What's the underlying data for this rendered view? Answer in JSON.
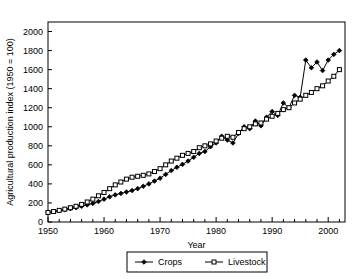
{
  "chart_data": {
    "type": "line",
    "title": "",
    "xlabel": "Year",
    "ylabel": "Agricultural production index (1950 = 100)",
    "xlim": [
      1950,
      2003
    ],
    "ylim": [
      0,
      2100
    ],
    "xticks": [
      1950,
      1960,
      1970,
      1980,
      1990,
      2000
    ],
    "xtick_labels": [
      "1950",
      "1960",
      "1970",
      "1980",
      "1990",
      "2000"
    ],
    "x_minor_tick_step": 2,
    "yticks": [
      0,
      200,
      400,
      600,
      800,
      1000,
      1200,
      1400,
      1600,
      1800,
      2000
    ],
    "ytick_labels": [
      "0",
      "200",
      "400",
      "600",
      "800",
      "1000",
      "1200",
      "1400",
      "1600",
      "1800",
      "2000"
    ],
    "grid": false,
    "legend_position": "below-center",
    "x": [
      1950,
      1951,
      1952,
      1953,
      1954,
      1955,
      1956,
      1957,
      1958,
      1959,
      1960,
      1961,
      1962,
      1963,
      1964,
      1965,
      1966,
      1967,
      1968,
      1969,
      1970,
      1971,
      1972,
      1973,
      1974,
      1975,
      1976,
      1977,
      1978,
      1979,
      1980,
      1981,
      1982,
      1983,
      1984,
      1985,
      1986,
      1987,
      1988,
      1989,
      1990,
      1991,
      1992,
      1993,
      1994,
      1995,
      1996,
      1997,
      1998,
      1999,
      2000,
      2001,
      2002
    ],
    "series": [
      {
        "name": "Crops",
        "marker": "filled-diamond",
        "color": "#000000",
        "values": [
          100,
          108,
          118,
          128,
          140,
          150,
          165,
          180,
          195,
          215,
          240,
          265,
          285,
          300,
          315,
          330,
          350,
          375,
          400,
          430,
          460,
          500,
          540,
          575,
          605,
          640,
          680,
          720,
          740,
          790,
          830,
          900,
          860,
          830,
          930,
          1000,
          980,
          1060,
          1010,
          1100,
          1160,
          1120,
          1250,
          1200,
          1330,
          1310,
          1700,
          1620,
          1680,
          1590,
          1700,
          1760,
          1800
        ]
      },
      {
        "name": "Livestock",
        "marker": "open-square",
        "color": "#000000",
        "values": [
          100,
          110,
          122,
          135,
          150,
          165,
          185,
          210,
          240,
          275,
          310,
          350,
          390,
          420,
          450,
          470,
          480,
          490,
          505,
          530,
          560,
          600,
          640,
          670,
          700,
          720,
          740,
          780,
          800,
          820,
          850,
          880,
          900,
          890,
          940,
          980,
          1000,
          1030,
          1040,
          1080,
          1110,
          1140,
          1180,
          1200,
          1250,
          1290,
          1330,
          1360,
          1400,
          1430,
          1480,
          1530,
          1600
        ]
      }
    ]
  },
  "legend": {
    "entries": [
      {
        "label": "Crops"
      },
      {
        "label": "Livestock"
      }
    ]
  }
}
